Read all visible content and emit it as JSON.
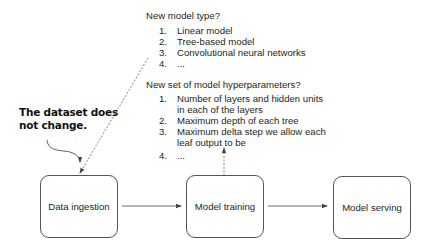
{
  "model_type_block": {
    "question": "New model type?",
    "items": [
      {
        "num": "1.",
        "text": "Linear model"
      },
      {
        "num": "2.",
        "text": "Tree-based model"
      },
      {
        "num": "3.",
        "text": "Convolutional neural networks"
      },
      {
        "num": "4.",
        "text": "..."
      }
    ]
  },
  "hyperparam_block": {
    "question": "New set of model hyperparameters?",
    "items": [
      {
        "num": "1.",
        "text": "Number of layers and hidden units",
        "text2": "in each of the layers"
      },
      {
        "num": "2.",
        "text": "Maximum depth of each tree"
      },
      {
        "num": "3.",
        "text": "Maximum delta step we allow each",
        "text2": "leaf output to be"
      },
      {
        "num": "4.",
        "text": "..."
      }
    ]
  },
  "callout": {
    "line1": "The dataset does",
    "line2": "not change."
  },
  "pipeline": {
    "steps": [
      {
        "label": "Data ingestion"
      },
      {
        "label": "Model training"
      },
      {
        "label": "Model serving"
      }
    ]
  },
  "colors": {
    "stroke": "#555555",
    "text": "#231f20"
  }
}
